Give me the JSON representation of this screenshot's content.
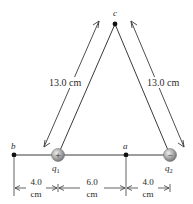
{
  "diagram": {
    "type": "physics-charges",
    "points": {
      "b": {
        "label": "b"
      },
      "a": {
        "label": "a"
      },
      "c": {
        "label": "c"
      }
    },
    "charges": {
      "q1": {
        "label": "q",
        "subscript": "1",
        "sign": "+"
      },
      "q2": {
        "label": "q",
        "subscript": "2",
        "sign": "−"
      }
    },
    "distances": {
      "q1_to_c": "13.0 cm",
      "q2_to_c": "13.0 cm",
      "b_to_q1": {
        "value": "4.0",
        "unit": "cm"
      },
      "q1_to_a": {
        "value": "6.0",
        "unit": "cm"
      },
      "a_to_q2": {
        "value": "4.0",
        "unit": "cm"
      }
    },
    "colors": {
      "line": "#3a3a3a",
      "charge_fill": "#9a9a9a",
      "charge_highlight": "#e0e0e0"
    }
  }
}
